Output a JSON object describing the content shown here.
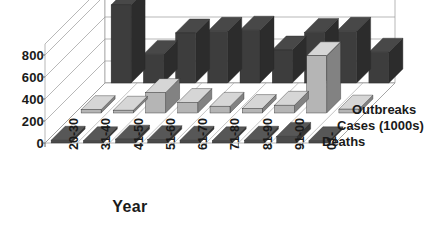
{
  "chart_data": {
    "type": "bar",
    "subtype": "3d-grouped-bar",
    "title": "",
    "xlabel": "Year",
    "ylabel": "",
    "categories": [
      "20-30",
      "31-40",
      "41-50",
      "51-60",
      "61-70",
      "71-80",
      "81-90",
      "91-00",
      "01-"
    ],
    "ytick_labels": [
      "800",
      "600",
      "400",
      "200",
      "0"
    ],
    "ytick_values": [
      800,
      600,
      400,
      200,
      0
    ],
    "ylim": [
      0,
      900
    ],
    "grid": true,
    "legend_position": "right-depth-axis",
    "series": [
      {
        "name": "Outbreaks",
        "color": "#3d3d3d",
        "values": [
          710,
          260,
          455,
          470,
          480,
          300,
          460,
          470,
          280
        ]
      },
      {
        "name": "Cases (1000s)",
        "color": "#b5b5b5",
        "values": [
          30,
          25,
          185,
          95,
          60,
          40,
          70,
          520,
          35
        ]
      },
      {
        "name": "Deaths",
        "color": "#4a4a4a",
        "values": [
          25,
          20,
          35,
          30,
          25,
          20,
          25,
          60,
          20
        ]
      }
    ]
  },
  "axes": {
    "x_title": "Year",
    "y_ticks": [
      "800",
      "600",
      "400",
      "200",
      "0"
    ]
  },
  "series_labels": {
    "outbreaks": "Outbreaks",
    "cases": "Cases (1000s)",
    "deaths": "Deaths"
  },
  "colors": {
    "series_outbreaks": "#3d3d3d",
    "series_cases": "#b5b5b5",
    "series_deaths": "#4a4a4a",
    "grid": "#9a9a9a",
    "floor": "#ffffff",
    "text": "#1a1a1a"
  }
}
